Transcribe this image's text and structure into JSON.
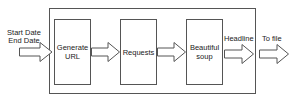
{
  "diagram": {
    "input_label": {
      "line1": "Start Date",
      "line2": "End Date"
    },
    "stages": [
      {
        "line1": "Generate",
        "line2": "URL"
      },
      {
        "line1": "Requests",
        "line2": ""
      },
      {
        "line1": "Beautiful",
        "line2": "soup"
      }
    ],
    "output_labels": [
      "Headline",
      "To file"
    ],
    "arrow_icons": [
      "block-arrow-right",
      "block-arrow-right",
      "block-arrow-right",
      "block-arrow-right",
      "block-arrow-right"
    ]
  }
}
